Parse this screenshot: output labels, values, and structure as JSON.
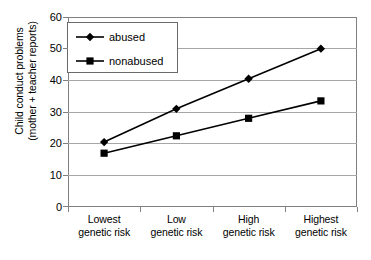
{
  "chart_data": {
    "type": "line",
    "title": "",
    "xlabel": "",
    "ylabel": "Child conduct problems (mother + teacher reports)",
    "ylabel_lines": [
      "Child conduct problems",
      "(mother + teacher reports)"
    ],
    "categories": [
      "Lowest genetic risk",
      "Low genetic risk",
      "High genetic risk",
      "Highest genetic risk"
    ],
    "category_lines": [
      [
        "Lowest",
        "genetic risk"
      ],
      [
        "Low",
        "genetic risk"
      ],
      [
        "High",
        "genetic risk"
      ],
      [
        "Highest",
        "genetic risk"
      ]
    ],
    "series": [
      {
        "name": "abused",
        "marker": "diamond",
        "color": "#000000",
        "values": [
          20.5,
          31.0,
          40.5,
          50.0
        ]
      },
      {
        "name": "nonabused",
        "marker": "square",
        "color": "#000000",
        "values": [
          17.0,
          22.5,
          28.0,
          33.5
        ]
      }
    ],
    "ylim": [
      0,
      60
    ],
    "yticks": [
      0,
      10,
      20,
      30,
      40,
      50,
      60
    ],
    "ytick_labels": [
      "0",
      "10",
      "20",
      "30",
      "40",
      "50",
      "60"
    ],
    "grid": "horizontal",
    "legend_position": "top-left",
    "plot_border_color": "#808080",
    "gridline_color": "#a6a6a6"
  }
}
